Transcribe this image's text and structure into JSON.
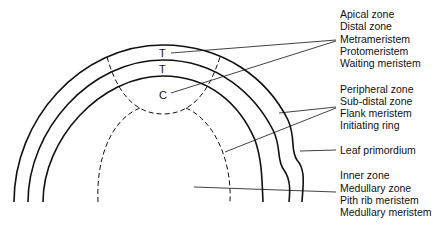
{
  "diagram": {
    "inner_labels": {
      "tunica_outer": "T",
      "tunica_inner": "T",
      "corpus": "C"
    },
    "label_groups": [
      {
        "id": "apical",
        "lines": [
          "Apical zone",
          "Distal zone",
          "Metrameristem",
          "Protomeristem",
          "Waiting meristem"
        ]
      },
      {
        "id": "peripheral",
        "lines": [
          "Peripheral zone",
          "Sub-distal zone",
          "Flank meristem",
          "Initiating ring"
        ]
      },
      {
        "id": "leaf",
        "lines": [
          "Leaf primordium"
        ]
      },
      {
        "id": "inner",
        "lines": [
          "Inner zone",
          "Medullary zone",
          "Pith rib meristem",
          "Medullary meristem"
        ]
      }
    ],
    "colors": {
      "line": "#111111",
      "background": "#ffffff"
    }
  }
}
